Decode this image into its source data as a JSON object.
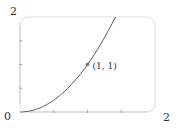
{
  "chart_data": {
    "type": "line",
    "title": "",
    "xlabel": "",
    "ylabel": "",
    "xlim": [
      0,
      2
    ],
    "ylim": [
      0,
      2
    ],
    "grid": false,
    "x_ticks": [
      0.5,
      1,
      1.5
    ],
    "y_ticks": [
      0.5,
      1,
      1.5
    ],
    "tick_labels": {
      "origin": "0",
      "x_max": "2",
      "y_max": "2"
    },
    "series": [
      {
        "name": "y = x^2",
        "function": "x^2",
        "x": [
          0,
          0.2,
          0.4,
          0.6,
          0.8,
          1.0,
          1.2,
          1.4,
          1.4142
        ],
        "y": [
          0,
          0.04,
          0.16,
          0.36,
          0.64,
          1.0,
          1.44,
          1.96,
          2.0
        ],
        "color": "#555555"
      }
    ],
    "annotations": [
      {
        "label": "(1, 1)",
        "x": 1,
        "y": 1
      }
    ],
    "colors": {
      "frame": "#dddddd",
      "curve": "#555555",
      "marker": "#777777",
      "text": "#333333"
    }
  }
}
